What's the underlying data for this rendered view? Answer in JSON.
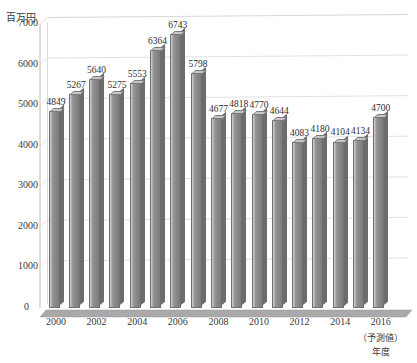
{
  "chart_data": {
    "type": "bar",
    "title": "",
    "subtitle": "",
    "unit_label": "百万円",
    "xlabel": "年度",
    "ylabel": "",
    "ylim": [
      0,
      7000
    ],
    "ytick_step": 1000,
    "yticks": [
      "0",
      "1000",
      "2000",
      "3000",
      "4000",
      "5000",
      "6000",
      "7000"
    ],
    "grid": true,
    "legend": "none",
    "legend_position": "none",
    "categories": [
      "2000",
      "2001",
      "2002",
      "2003",
      "2004",
      "2005",
      "2006",
      "2007",
      "2008",
      "2009",
      "2010",
      "2011",
      "2012",
      "2013",
      "2014",
      "2015",
      "2016"
    ],
    "xtick_labels_shown": [
      "2000",
      "2002",
      "2004",
      "2006",
      "2008",
      "2010",
      "2012",
      "2014",
      "2016"
    ],
    "values": [
      4849,
      5267,
      5640,
      5275,
      5553,
      6364,
      6743,
      5798,
      4677,
      4818,
      4770,
      4644,
      4083,
      4180,
      4104,
      4134,
      4700
    ],
    "data_labels": [
      "4849",
      "5267",
      "5640",
      "5275",
      "5553",
      "6364",
      "6743",
      "5798",
      "4677",
      "4818",
      "4770",
      "4644",
      "4083",
      "4180",
      "4104",
      "4134",
      "4700"
    ],
    "annotations": [
      {
        "text": "（予測値）",
        "target_category": "2016"
      }
    ],
    "colors": {
      "bar_face": "#8a8a8a",
      "bar_highlight": "#d2d2d2",
      "bar_side": "#6c6c6c",
      "bar_top": "#c6c6c6",
      "bar_outline": "#6f6f6f",
      "gridline": "#d9d9d9",
      "axis": "#b5b5b5",
      "floor": "#b0b0b0",
      "text": "#3a3a3a",
      "background": "#ffffff"
    }
  },
  "axis": {
    "zero_label": "0",
    "x_note": "（予測値）",
    "x_title": "年度"
  }
}
